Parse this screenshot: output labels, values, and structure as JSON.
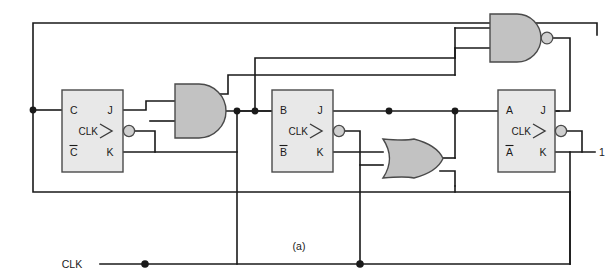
{
  "figure": {
    "caption": "(a)",
    "constant_input_label": "1",
    "clock_label": "CLK",
    "colors": {
      "wire": "#1a1a1a",
      "flipflop_fill": "#e8e8e8",
      "gate_fill": "#c2c2c2",
      "outline": "#4a4a4a",
      "background": "#ffffff"
    }
  },
  "flipflops": [
    {
      "id": "ff-c",
      "name": "flip-flop-c",
      "out_q": "C",
      "out_qbar": "C̅",
      "in_j": "J",
      "in_k": "K",
      "in_clk": "CLK",
      "clock_inverted": true,
      "edge_triggered": true
    },
    {
      "id": "ff-b",
      "name": "flip-flop-b",
      "out_q": "B",
      "out_qbar": "B̅",
      "in_j": "J",
      "in_k": "K",
      "in_clk": "CLK",
      "clock_inverted": true,
      "edge_triggered": true
    },
    {
      "id": "ff-a",
      "name": "flip-flop-a",
      "out_q": "A",
      "out_qbar": "A̅",
      "in_j": "J",
      "in_k": "K",
      "in_clk": "CLK",
      "clock_inverted": true,
      "edge_triggered": true
    }
  ],
  "gates": [
    {
      "id": "gate-and",
      "type": "AND",
      "inputs": 2,
      "inverted_output": false
    },
    {
      "id": "gate-or",
      "type": "OR",
      "inputs": 2,
      "inverted_output": false
    },
    {
      "id": "gate-nand",
      "type": "NAND",
      "inputs": 2,
      "inverted_output": true
    }
  ]
}
